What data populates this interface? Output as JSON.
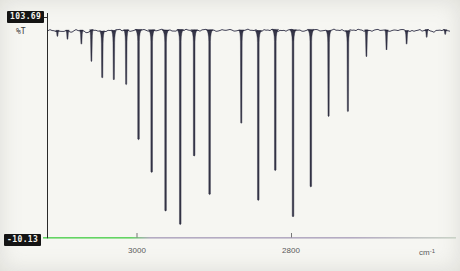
{
  "chart_data": {
    "type": "line",
    "ylabel": "%T",
    "y_max_label": "103.69",
    "y_min_label": "-10.13",
    "ylim": [
      -10.13,
      103.69
    ],
    "xlabel_base": "cm",
    "xlabel_exp": "-1",
    "xlim": [
      3117,
      2586
    ],
    "x_axis_reversed": true,
    "x_ticks": [
      {
        "value": 3000,
        "label": "3000"
      },
      {
        "value": 2800,
        "label": "2800"
      }
    ],
    "grid": false,
    "legend": "none",
    "baseline_transmittance": 97.3,
    "colors": {
      "curve": "#26263a",
      "axis_left_segment_green": "#63d463",
      "axis_right_segment_purple": "#b4abc2",
      "axis_far_right_pale": "#c9d2c6",
      "y_axis": "#2a2a2a",
      "tick": "#777777"
    },
    "peaks": [
      {
        "wavenumber": 3103,
        "min_transmittance": 94.0
      },
      {
        "wavenumber": 3090,
        "min_transmittance": 92.5
      },
      {
        "wavenumber": 3072,
        "min_transmittance": 90.0
      },
      {
        "wavenumber": 3059,
        "min_transmittance": 81.0
      },
      {
        "wavenumber": 3045,
        "min_transmittance": 72.5
      },
      {
        "wavenumber": 3030,
        "min_transmittance": 71.5
      },
      {
        "wavenumber": 3014,
        "min_transmittance": 69.0
      },
      {
        "wavenumber": 2998,
        "min_transmittance": 40.5
      },
      {
        "wavenumber": 2981,
        "min_transmittance": 23.5
      },
      {
        "wavenumber": 2963,
        "min_transmittance": 3.5
      },
      {
        "wavenumber": 2944,
        "min_transmittance": -3.5
      },
      {
        "wavenumber": 2926,
        "min_transmittance": 32.0
      },
      {
        "wavenumber": 2906,
        "min_transmittance": 12.0
      },
      {
        "wavenumber": 2865,
        "min_transmittance": 49.0
      },
      {
        "wavenumber": 2843,
        "min_transmittance": 9.0
      },
      {
        "wavenumber": 2821,
        "min_transmittance": 24.5
      },
      {
        "wavenumber": 2798,
        "min_transmittance": 0.5
      },
      {
        "wavenumber": 2775,
        "min_transmittance": 16.0
      },
      {
        "wavenumber": 2752,
        "min_transmittance": 52.5
      },
      {
        "wavenumber": 2727,
        "min_transmittance": 55.0
      },
      {
        "wavenumber": 2703,
        "min_transmittance": 83.5
      },
      {
        "wavenumber": 2677,
        "min_transmittance": 87.0
      },
      {
        "wavenumber": 2651,
        "min_transmittance": 90.0
      },
      {
        "wavenumber": 2625,
        "min_transmittance": 93.5
      },
      {
        "wavenumber": 2601,
        "min_transmittance": 95.0
      }
    ]
  }
}
